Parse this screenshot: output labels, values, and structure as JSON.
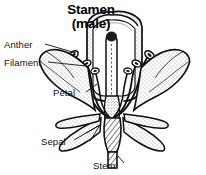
{
  "figure": {
    "kind": "botanical-diagram",
    "background_color": "#ffffff",
    "ink_color": "#111111",
    "width": 206,
    "height": 175
  },
  "title": {
    "line1": "Stamen",
    "line2": "(male)"
  },
  "labels": {
    "anther": "Anther",
    "filament": "Filament",
    "petal": "Petal",
    "sepal": "Sepal",
    "stem": "Stem"
  },
  "parts": [
    {
      "name": "anther",
      "label": "Anther",
      "description": "pollen-bearing oval tip of the stamen"
    },
    {
      "name": "filament",
      "label": "Filament",
      "description": "slender stalk supporting the anther"
    },
    {
      "name": "petal",
      "label": "Petal",
      "description": "stippled corolla lobe spreading outward"
    },
    {
      "name": "sepal",
      "label": "Sepal",
      "description": "narrow leaf-like segment beneath the petals"
    },
    {
      "name": "stem",
      "label": "Stem",
      "description": "hatched stalk below the flower"
    }
  ]
}
